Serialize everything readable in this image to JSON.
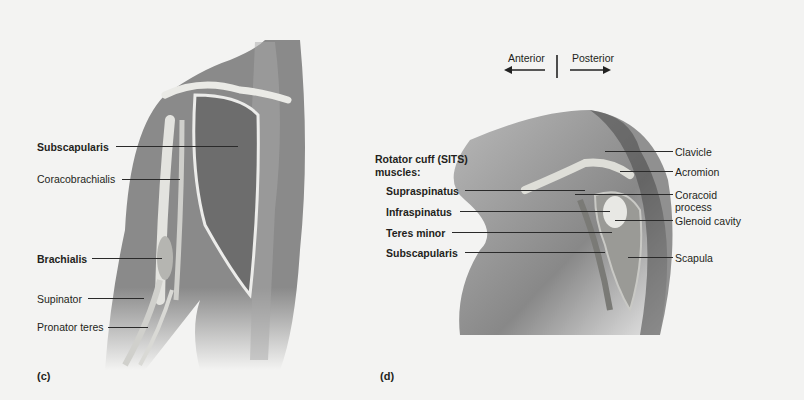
{
  "figure_c": {
    "panel_label": "(c)",
    "labels": [
      {
        "text": "Subscapularis",
        "bold": true
      },
      {
        "text": "Coracobrachialis",
        "bold": false
      },
      {
        "text": "Brachialis",
        "bold": true
      },
      {
        "text": "Supinator",
        "bold": false
      },
      {
        "text": "Pronator teres",
        "bold": false
      }
    ]
  },
  "figure_d": {
    "panel_label": "(d)",
    "orientation": {
      "left": "Anterior",
      "right": "Posterior"
    },
    "group_title_line1": "Rotator cuff (SITS)",
    "group_title_line2": "muscles:",
    "muscles": [
      "Supraspinatus",
      "Infraspinatus",
      "Teres minor",
      "Subscapularis"
    ],
    "structures": [
      "Clavicle",
      "Acromion",
      "Coracoid",
      "process",
      "Glenoid cavity",
      "Scapula"
    ]
  },
  "colors": {
    "background": "#f3f3f2",
    "skin": "#8d8d8d",
    "bone": "#e6e6e2",
    "text": "#231f20"
  }
}
